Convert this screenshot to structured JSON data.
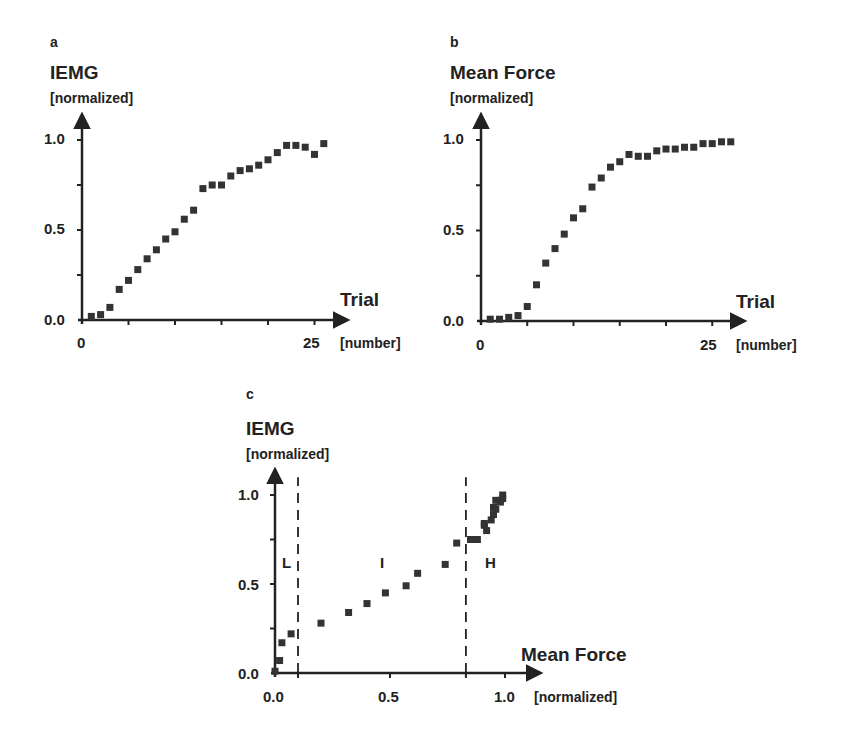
{
  "chart_data": [
    {
      "panel": "a",
      "type": "scatter",
      "title": "",
      "ylabel": "IEMG",
      "ylabel_unit": "[normalized]",
      "xlabel": "Trial",
      "xlabel_unit": "[number]",
      "xlim": [
        0,
        28
      ],
      "ylim": [
        0,
        1.1
      ],
      "xticks": [
        "0",
        "25"
      ],
      "yticks": [
        "0.0",
        "0.5",
        "1.0"
      ],
      "grid": false,
      "marker": "square",
      "x": [
        1,
        2,
        3,
        4,
        5,
        6,
        7,
        8,
        9,
        10,
        11,
        12,
        13,
        14,
        15,
        16,
        17,
        18,
        19,
        20,
        21,
        22,
        23,
        24,
        25,
        26
      ],
      "y": [
        0.02,
        0.03,
        0.07,
        0.17,
        0.22,
        0.28,
        0.34,
        0.39,
        0.45,
        0.49,
        0.56,
        0.61,
        0.73,
        0.75,
        0.75,
        0.8,
        0.83,
        0.84,
        0.86,
        0.89,
        0.93,
        0.97,
        0.97,
        0.96,
        0.92,
        0.98
      ]
    },
    {
      "panel": "b",
      "type": "scatter",
      "title": "",
      "ylabel": "Mean Force",
      "ylabel_unit": "[normalized]",
      "xlabel": "Trial",
      "xlabel_unit": "[number]",
      "xlim": [
        0,
        28
      ],
      "ylim": [
        0,
        1.1
      ],
      "xticks": [
        "0",
        "25"
      ],
      "yticks": [
        "0.0",
        "0.5",
        "1.0"
      ],
      "grid": false,
      "marker": "square",
      "x": [
        1,
        2,
        3,
        4,
        5,
        6,
        7,
        8,
        9,
        10,
        11,
        12,
        13,
        14,
        15,
        16,
        17,
        18,
        19,
        20,
        21,
        22,
        23,
        24,
        25,
        26,
        27
      ],
      "y": [
        0.01,
        0.01,
        0.02,
        0.03,
        0.08,
        0.2,
        0.32,
        0.4,
        0.48,
        0.57,
        0.62,
        0.74,
        0.79,
        0.85,
        0.88,
        0.92,
        0.91,
        0.91,
        0.94,
        0.95,
        0.95,
        0.96,
        0.96,
        0.98,
        0.98,
        0.99,
        0.99
      ]
    },
    {
      "panel": "c",
      "type": "scatter",
      "title": "",
      "ylabel": "IEMG",
      "ylabel_unit": "[normalized]",
      "xlabel": "Mean Force",
      "xlabel_unit": "[normalized]",
      "xlim": [
        0,
        1.12
      ],
      "ylim": [
        0,
        1.1
      ],
      "xticks": [
        "0.0",
        "0.5",
        "1.0"
      ],
      "yticks": [
        "0.0",
        "0.5",
        "1.0"
      ],
      "grid": false,
      "marker": "square",
      "vlines": [
        0.1,
        0.83
      ],
      "annotations": [
        {
          "text": "L",
          "x": 0.05,
          "y": 0.63
        },
        {
          "text": "I",
          "x": 0.46,
          "y": 0.63
        },
        {
          "text": "H",
          "x": 0.93,
          "y": 0.63
        }
      ],
      "x": [
        0.0,
        0.02,
        0.03,
        0.07,
        0.2,
        0.32,
        0.4,
        0.48,
        0.57,
        0.62,
        0.74,
        0.79,
        0.85,
        0.88,
        0.92,
        0.91,
        0.91,
        0.94,
        0.95,
        0.95,
        0.96,
        0.96,
        0.98,
        0.98,
        0.99,
        0.99
      ],
      "y": [
        0.01,
        0.07,
        0.17,
        0.22,
        0.28,
        0.34,
        0.39,
        0.45,
        0.49,
        0.56,
        0.61,
        0.73,
        0.75,
        0.75,
        0.8,
        0.83,
        0.84,
        0.86,
        0.89,
        0.93,
        0.92,
        0.97,
        0.97,
        0.96,
        0.98,
        1.0
      ]
    }
  ],
  "panels": {
    "a": {
      "letter": "a",
      "ytitle": "IEMG",
      "yunit": "[normalized]",
      "xtitle": "Trial",
      "xunit": "[number]",
      "yticks": [
        "1.0",
        "0.5",
        "0.0"
      ],
      "xticks": [
        "0",
        "25"
      ]
    },
    "b": {
      "letter": "b",
      "ytitle": "Mean Force",
      "yunit": "[normalized]",
      "xtitle": "Trial",
      "xunit": "[number]",
      "yticks": [
        "1.0",
        "0.5",
        "0.0"
      ],
      "xticks": [
        "0",
        "25"
      ]
    },
    "c": {
      "letter": "c",
      "ytitle": "IEMG",
      "yunit": "[normalized]",
      "xtitle": "Mean Force",
      "xunit": "[normalized]",
      "yticks": [
        "1.0",
        "0.5",
        "0.0"
      ],
      "xticks": [
        "0.0",
        "0.5",
        "1.0"
      ],
      "regions": [
        "L",
        "I",
        "H"
      ]
    }
  },
  "colors": {
    "ink": "#222222",
    "marker": "#333333",
    "background": "#ffffff"
  }
}
